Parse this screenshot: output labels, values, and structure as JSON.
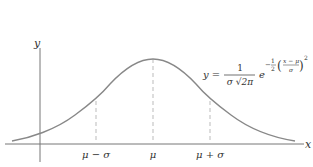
{
  "diagram": {
    "axes": {
      "x_label": "x",
      "y_label": "y"
    },
    "ticks": [
      {
        "label": "μ − σ",
        "x": 96
      },
      {
        "label": "μ",
        "x": 153
      },
      {
        "label": "μ + σ",
        "x": 210
      }
    ],
    "formula": {
      "lhs": "y =",
      "numerator": "1",
      "denominator": "σ √2π",
      "base": "e",
      "exp_coef_num": "1",
      "exp_coef_den": "2",
      "exp_frac_num": "x − μ",
      "exp_frac_den": "σ",
      "exp_power": "2",
      "minus": "−"
    },
    "colors": {
      "curve": "#888888",
      "axis": "#777777",
      "dashed": "#bbbbbb",
      "text": "#333333"
    }
  }
}
